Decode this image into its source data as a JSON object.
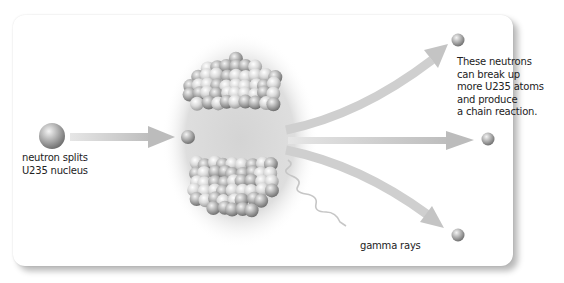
{
  "diagram": {
    "labels": {
      "neutron_split": [
        "neutron splits",
        "U235 nucleus"
      ],
      "chain_reaction": [
        "These neutrons",
        "can break up",
        "more U235 atoms",
        "and produce",
        "a chain reaction."
      ],
      "gamma": "gamma rays"
    },
    "nodes": [
      {
        "id": "incoming-neutron",
        "type": "neutron"
      },
      {
        "id": "u235-nucleus",
        "type": "nucleus",
        "state": "splitting into two fragments"
      },
      {
        "id": "released-neutron-top",
        "type": "neutron"
      },
      {
        "id": "released-neutron-middle",
        "type": "neutron"
      },
      {
        "id": "released-neutron-bottom",
        "type": "neutron"
      }
    ],
    "edges": [
      {
        "from": "incoming-neutron",
        "to": "u235-nucleus",
        "style": "straight arrow"
      },
      {
        "from": "u235-nucleus",
        "to": "released-neutron-top",
        "style": "curved arrow up"
      },
      {
        "from": "u235-nucleus",
        "to": "released-neutron-middle",
        "style": "straight arrow"
      },
      {
        "from": "u235-nucleus",
        "to": "released-neutron-bottom",
        "style": "curved arrow down"
      },
      {
        "from": "u235-nucleus",
        "to": "gamma rays",
        "style": "wavy line"
      }
    ],
    "colors": {
      "neutron": "#a8a8a8",
      "arrow": "#c8c8c8",
      "glow": "#d9d9d9",
      "text": "#222222"
    }
  }
}
